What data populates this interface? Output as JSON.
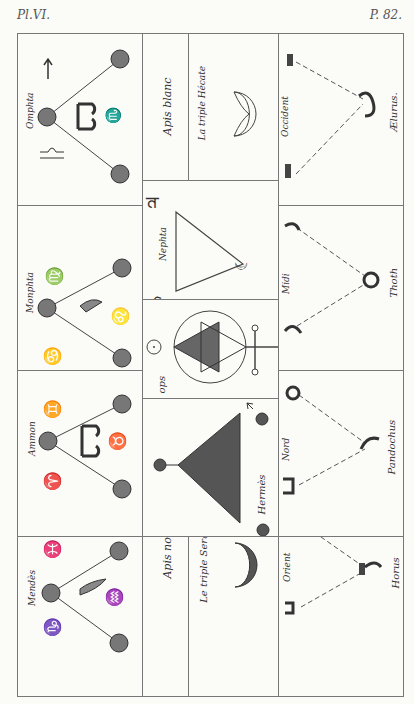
{
  "header": {
    "plate_label": "Pl.VI.",
    "page_label": "P. 82."
  },
  "left_column": [
    {
      "label": "Omphta"
    },
    {
      "label": "Monphta"
    },
    {
      "label": "Ammon"
    },
    {
      "label": "Mendès"
    }
  ],
  "middle_column": {
    "apis_blanc": "Apis blanc",
    "triple_hecate": "La triple Hécate",
    "nephta": "Nephta",
    "ops": "ops",
    "hermes": "Hermès",
    "apis_noir": "Apis noir",
    "triple_serapis": "Le triple Serapis"
  },
  "right_column": [
    {
      "direction": "Occident",
      "deity": "Ælurus."
    },
    {
      "direction": "Midi",
      "deity": "Thoth"
    },
    {
      "direction": "Nord",
      "deity": "Pandochus"
    },
    {
      "direction": "Orient",
      "deity": "Horus"
    }
  ]
}
